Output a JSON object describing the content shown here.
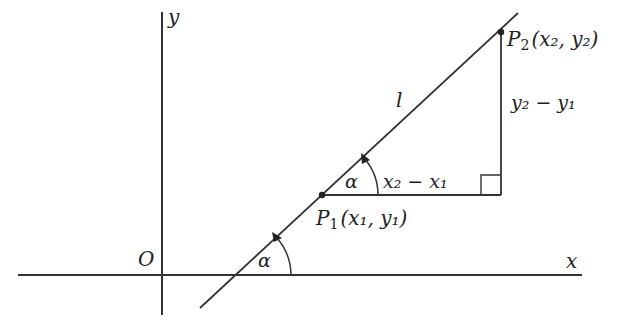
{
  "diagram": {
    "axes": {
      "x_label": "x",
      "y_label": "y",
      "origin_label": "O"
    },
    "line_label": "l",
    "points": [
      {
        "name": "P1",
        "label_main": "P",
        "label_sub": "1",
        "coords": "(x₁, y₁)"
      },
      {
        "name": "P2",
        "label_main": "P",
        "label_sub": "2",
        "coords": "(x₂, y₂)"
      }
    ],
    "angle_label": "α",
    "horizontal_leg_label": "x₂ − x₁",
    "vertical_leg_label": "y₂ − y₁",
    "colors": {
      "stroke": "#333333",
      "text": "#222222",
      "background": "#ffffff"
    }
  }
}
